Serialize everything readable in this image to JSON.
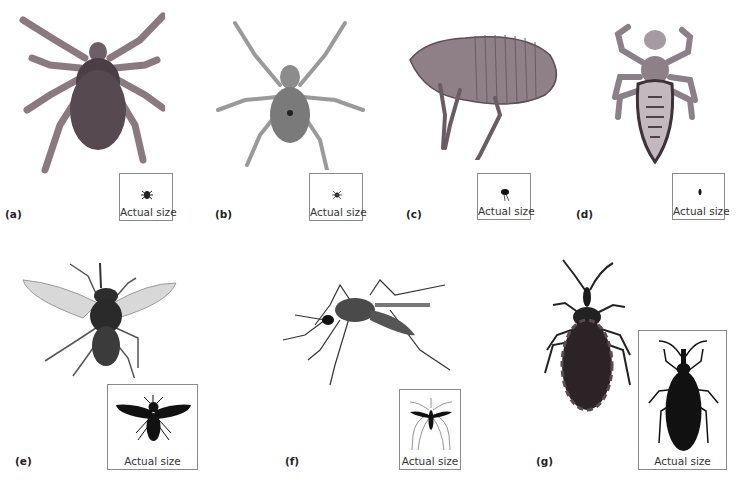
{
  "figure": {
    "panels": [
      {
        "id": "a",
        "label": "(a)",
        "specimen": "tick",
        "size_box_caption": "Actual size"
      },
      {
        "id": "b",
        "label": "(b)",
        "specimen": "mite",
        "size_box_caption": "Actual size"
      },
      {
        "id": "c",
        "label": "(c)",
        "specimen": "flea",
        "size_box_caption": "Actual size"
      },
      {
        "id": "d",
        "label": "(d)",
        "specimen": "louse",
        "size_box_caption": "Actual size"
      },
      {
        "id": "e",
        "label": "(e)",
        "specimen": "tsetse-fly",
        "size_box_caption": "Actual size"
      },
      {
        "id": "f",
        "label": "(f)",
        "specimen": "mosquito",
        "size_box_caption": "Actual size"
      },
      {
        "id": "g",
        "label": "(g)",
        "specimen": "kissing-bug",
        "size_box_caption": "Actual size"
      }
    ]
  }
}
